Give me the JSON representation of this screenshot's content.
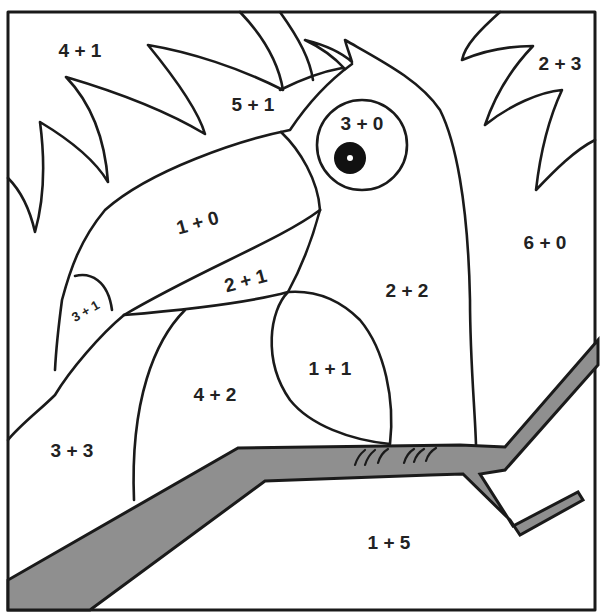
{
  "page": {
    "background": "#ffffff",
    "line_color": "#1a1a1a",
    "branch_color": "#8f8f8f"
  },
  "regions": [
    {
      "id": "sky-top-left",
      "label": "4 + 1",
      "x": 80,
      "y": 52
    },
    {
      "id": "leaf-top-middle",
      "label": "5 + 1",
      "x": 253,
      "y": 106
    },
    {
      "id": "eye",
      "label": "3 + 0",
      "x": 362,
      "y": 125
    },
    {
      "id": "sky-top-right",
      "label": "2 + 3",
      "x": 560,
      "y": 65
    },
    {
      "id": "beak-upper",
      "label": "1 + 0",
      "x": 198,
      "y": 224
    },
    {
      "id": "beak-lower",
      "label": "2 + 1",
      "x": 246,
      "y": 282
    },
    {
      "id": "beak-tip",
      "label": "3 + 1",
      "x": 86,
      "y": 312
    },
    {
      "id": "bird-chest",
      "label": "2 + 2",
      "x": 407,
      "y": 292
    },
    {
      "id": "sky-right",
      "label": "6 + 0",
      "x": 545,
      "y": 244
    },
    {
      "id": "wing",
      "label": "1 + 1",
      "x": 330,
      "y": 370
    },
    {
      "id": "bird-belly",
      "label": "4 + 2",
      "x": 215,
      "y": 396
    },
    {
      "id": "sky-bottom-left",
      "label": "3 + 3",
      "x": 72,
      "y": 452
    },
    {
      "id": "ground-bottom",
      "label": "1 + 5",
      "x": 389,
      "y": 544
    }
  ]
}
